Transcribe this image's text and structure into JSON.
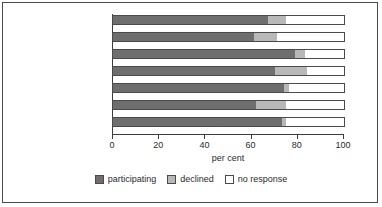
{
  "chart_data": {
    "type": "bar",
    "orientation": "horizontal",
    "stacked": true,
    "title": "",
    "xlabel": "per cent",
    "ylabel": "",
    "xlim": [
      0,
      100
    ],
    "xticks": [
      0,
      20,
      40,
      60,
      80,
      100
    ],
    "grid": false,
    "legend_position": "bottom",
    "categories": [
      "Total (211)",
      "Other (61)",
      "Outer London (20)",
      "Inner London (13)",
      "Metro (36)",
      "Unitary (46)",
      "Shire (35)"
    ],
    "series": [
      {
        "name": "participating",
        "color": "#6e6e6e",
        "values": [
          67,
          61,
          79,
          70,
          74,
          62,
          73
        ]
      },
      {
        "name": "declined",
        "color": "#b8b8b8",
        "values": [
          8,
          10,
          4,
          14,
          2,
          13,
          2
        ]
      },
      {
        "name": "no response",
        "color": "#ffffff",
        "values": [
          25,
          29,
          17,
          16,
          24,
          25,
          25
        ]
      }
    ]
  },
  "axis": {
    "title": "per cent",
    "tick_labels": [
      "0",
      "20",
      "40",
      "60",
      "80",
      "100"
    ]
  },
  "legend": {
    "items": [
      {
        "label": "participating",
        "color": "#6e6e6e"
      },
      {
        "label": "declined",
        "color": "#b8b8b8"
      },
      {
        "label": "no response",
        "color": "#ffffff"
      }
    ]
  },
  "colors": {
    "participating": "#6e6e6e",
    "declined": "#b8b8b8",
    "no_response": "#ffffff",
    "outline": "#4a4a4a",
    "text": "#2b2b2b"
  }
}
